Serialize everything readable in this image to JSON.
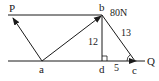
{
  "diagram": {
    "type": "force-vector-diagram",
    "colors": {
      "stroke": "#1a1a1a",
      "background": "#ffffff"
    },
    "labels": {
      "P": "P",
      "b": "b",
      "force": "80N",
      "bd_length": "12",
      "bc_length": "13",
      "Q": "Q",
      "a": "a",
      "d": "d",
      "dc_length": "5",
      "c": "c"
    },
    "points": {
      "P": [
        12,
        17
      ],
      "b": [
        102,
        15
      ],
      "a": [
        42,
        61
      ],
      "d": [
        102,
        61
      ],
      "c": [
        135,
        61
      ]
    },
    "segments": [
      {
        "name": "top-line",
        "from": "P-line-start",
        "to": "b"
      },
      {
        "name": "vector-aP",
        "from": "a",
        "to": "P",
        "arrow": true
      },
      {
        "name": "vector-ab",
        "from": "a",
        "to": "b",
        "arrow": true
      },
      {
        "name": "segment-bd",
        "from": "b",
        "to": "d"
      },
      {
        "name": "segment-bc",
        "from": "b",
        "to": "c"
      },
      {
        "name": "axis-line",
        "from": "left",
        "to": "Q",
        "arrow_at": "c"
      }
    ]
  }
}
